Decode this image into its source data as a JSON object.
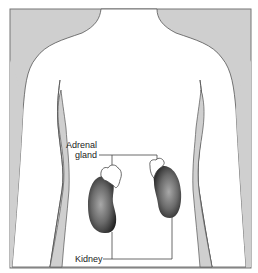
{
  "figure": {
    "labels": {
      "adrenal_line1": "Adrenal",
      "adrenal_line2": "gland",
      "kidney": "Kidney"
    },
    "colors": {
      "background": "#cfcfcf",
      "body": "#ffffff",
      "outline": "#555555",
      "kidney_dark": "#2a2a2a",
      "kidney_light": "#9a9a9a"
    }
  }
}
